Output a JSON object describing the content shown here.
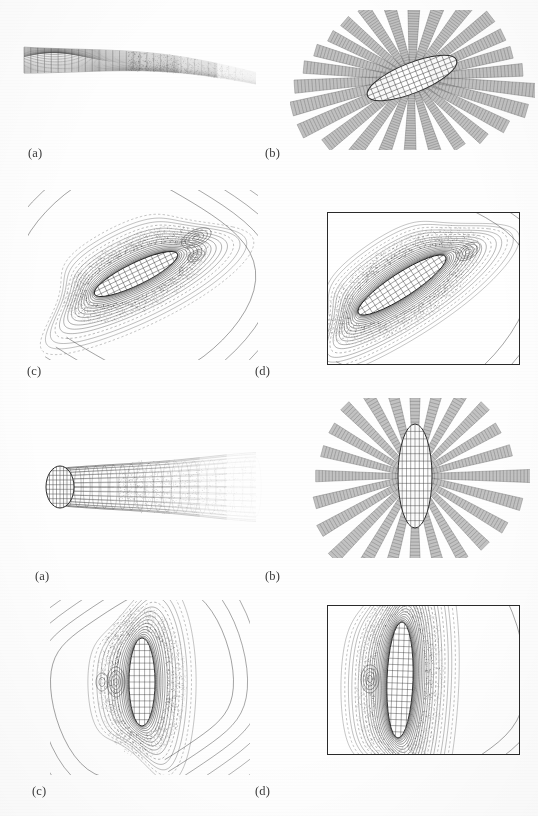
{
  "figure": {
    "background_color": "#ffffff",
    "ink_color": "#2a2a2a",
    "mesh_color": "#4a4a4a",
    "ribbon_color": "#8d8d8d",
    "width": 538,
    "height": 816
  },
  "groups": [
    {
      "id": "group-top",
      "description": "Obliquely incident illumination on a tilted prolate spheroid",
      "panels": [
        {
          "id": "top-a",
          "label": "(a)",
          "kind": "surface-mesh-3d",
          "caption_x": 28,
          "caption_y": 146,
          "description": "Three dimensional wire mesh of the scattered surface current distribution shown as a folded sheet"
        },
        {
          "id": "top-b",
          "label": "(b)",
          "kind": "radial-ribbons",
          "caption_x": 265,
          "caption_y": 146,
          "description": "Radiation pattern lobes drawn as shaded ribbons radiating from a tilted spheroid"
        },
        {
          "id": "top-c",
          "label": "(c)",
          "kind": "contour-field",
          "caption_x": 27,
          "caption_y": 364,
          "description": "Near field equi-amplitude contours about the tilted spheroid"
        },
        {
          "id": "top-d",
          "label": "(d)",
          "kind": "contour-field-boxed",
          "caption_x": 255,
          "caption_y": 364,
          "description": "Boxed detail of the near field contours around the tilted spheroid"
        }
      ]
    },
    {
      "id": "group-bottom",
      "description": "Axially incident illumination on an upright prolate spheroid",
      "panels": [
        {
          "id": "bottom-a",
          "label": "(a)",
          "kind": "surface-mesh-3d",
          "caption_x": 35,
          "caption_y": 569,
          "description": "Three dimensional wire mesh of the axial surface current shown as a tapering tube"
        },
        {
          "id": "bottom-b",
          "label": "(b)",
          "kind": "radial-ribbons",
          "caption_x": 265,
          "caption_y": 569,
          "description": "Symmetric radiation lobes drawn as shaded ribbons radiating from an upright spheroid"
        },
        {
          "id": "bottom-c",
          "label": "(c)",
          "kind": "contour-field",
          "caption_x": 32,
          "caption_y": 784,
          "description": "Near field equi-amplitude contours about the upright spheroid"
        },
        {
          "id": "bottom-d",
          "label": "(d)",
          "kind": "contour-field-boxed",
          "caption_x": 255,
          "caption_y": 784,
          "description": "Boxed detail of the near field contours around the upright spheroid"
        }
      ]
    }
  ],
  "chart_data": {
    "type": "contour",
    "xlabel": "",
    "ylabel": "",
    "panels": [
      {
        "panel": "(a) top",
        "plot_type": "surface",
        "scatterer": "prolate spheroid",
        "orientation_deg": 20,
        "aspect_ratio": 6.0,
        "surface_ridge_count": 34,
        "surface_rib_count": 26,
        "tail_decay": "exponential"
      },
      {
        "panel": "(b) top",
        "plot_type": "radiation-lobes",
        "orientation_deg": 20,
        "lobe_count": 26,
        "lobe_lengths_normalized": [
          0.95,
          0.88,
          0.8,
          0.74,
          0.7,
          0.68,
          0.7,
          0.76,
          0.84,
          0.92,
          1.0,
          0.93,
          0.82,
          0.72,
          0.66,
          0.62,
          0.66,
          0.72,
          0.82,
          0.9,
          0.98,
          0.9,
          0.8,
          0.72,
          0.68,
          0.74
        ]
      },
      {
        "panel": "(c) top",
        "plot_type": "contour",
        "orientation_deg": 20,
        "contour_levels": 18,
        "level_min": 0.05,
        "level_max": 0.95,
        "lobes": [
          "front-upper",
          "rear-lower",
          "side-secondary"
        ]
      },
      {
        "panel": "(d) top",
        "plot_type": "contour",
        "orientation_deg": 20,
        "contour_levels": 20,
        "level_min": 0.05,
        "level_max": 1.0,
        "framed": true,
        "frame_rect": [
          327,
          212,
          193,
          153
        ]
      },
      {
        "panel": "(a) bottom",
        "plot_type": "surface",
        "scatterer": "prolate spheroid",
        "orientation_deg": 0,
        "aspect_ratio": 4.0,
        "surface_ridge_count": 30,
        "surface_rib_count": 22,
        "tail_decay": "exponential"
      },
      {
        "panel": "(b) bottom",
        "plot_type": "radiation-lobes",
        "orientation_deg": 0,
        "lobe_count": 24,
        "lobe_lengths_normalized": [
          1.0,
          0.92,
          0.84,
          0.78,
          0.74,
          0.74,
          0.78,
          0.84,
          0.92,
          1.0,
          0.92,
          0.84,
          0.78,
          0.74,
          0.74,
          0.78,
          0.84,
          0.92,
          1.0,
          0.92,
          0.84,
          0.78,
          0.74,
          0.78
        ]
      },
      {
        "panel": "(c) bottom",
        "plot_type": "contour",
        "orientation_deg": 0,
        "contour_levels": 16,
        "level_min": 0.05,
        "level_max": 0.95,
        "lobes": [
          "forward",
          "rear-shadow",
          "side"
        ]
      },
      {
        "panel": "(d) bottom",
        "plot_type": "contour",
        "orientation_deg": 0,
        "contour_levels": 22,
        "level_min": 0.05,
        "level_max": 1.0,
        "framed": true,
        "frame_rect": [
          327,
          605,
          193,
          150
        ]
      }
    ]
  }
}
